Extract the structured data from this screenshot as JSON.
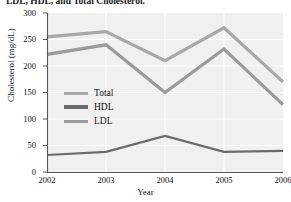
{
  "caption": {
    "text": "LDL, HDL, and Total Cholesterol."
  },
  "chart_data": {
    "type": "line",
    "title": "",
    "xlabel": "Year",
    "ylabel": "Cholesterol (mg/dL)",
    "categories": [
      "2002",
      "2003",
      "2004",
      "2005",
      "2006"
    ],
    "x": [
      2002,
      2003,
      2004,
      2005,
      2006
    ],
    "xlim": [
      2002,
      2006
    ],
    "ylim": [
      0,
      300
    ],
    "yticks": [
      0,
      50,
      100,
      150,
      200,
      250,
      300
    ],
    "xticks": [
      "2002",
      "2003",
      "2004",
      "2005",
      "2006"
    ],
    "grid": true,
    "grid_axis": "both",
    "legend_position": "center-left-inside",
    "series": [
      {
        "name": "Total",
        "color": "#a8a8a8",
        "values": [
          255,
          265,
          210,
          272,
          170
        ]
      },
      {
        "name": "HDL",
        "color": "#6b6b6b",
        "values": [
          32,
          38,
          68,
          38,
          40
        ]
      },
      {
        "name": "LDL",
        "color": "#9a9a9a",
        "values": [
          222,
          240,
          150,
          232,
          127
        ]
      }
    ]
  },
  "legend": {
    "items": [
      {
        "label": "Total",
        "color": "#a8a8a8"
      },
      {
        "label": "HDL",
        "color": "#6b6b6b"
      },
      {
        "label": "LDL",
        "color": "#9a9a9a"
      }
    ]
  },
  "axes": {
    "y_labels": [
      "300",
      "250",
      "200",
      "150",
      "100",
      "50",
      "0"
    ],
    "x_labels": [
      "2002",
      "2003",
      "2004",
      "2005",
      "2006"
    ],
    "y_title": "Cholesterol (mg/dL)",
    "x_title": "Year"
  },
  "colors": {
    "plot_background": "#f0f0f0",
    "grid": "#ffffff",
    "axis": "#555555",
    "text": "#111111"
  }
}
